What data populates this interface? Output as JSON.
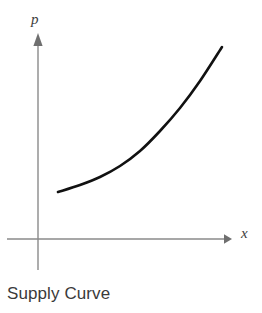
{
  "figure": {
    "caption": "Supply Curve",
    "background_color": "#ffffff",
    "axis_color": "#8a8a8a",
    "curve_color": "#111111",
    "label_color": "#3d3d3d",
    "caption_color": "#3a3a3a"
  },
  "axes": {
    "y_axis": {
      "label": "p",
      "label_name": "price",
      "arrow": "up",
      "x_px": 38,
      "top_px": 33,
      "bottom_px": 270
    },
    "x_axis": {
      "label": "x",
      "label_name": "quantity",
      "arrow": "right",
      "y_px": 239,
      "left_px": 7,
      "right_px": 231
    },
    "origin_px": {
      "x": 38,
      "y": 239
    }
  },
  "chart_data": {
    "type": "line",
    "title": "Supply Curve",
    "subtitle": "",
    "xlabel": "x",
    "ylabel": "p",
    "grid": false,
    "legend": null,
    "axis_arrows": true,
    "tick_labels": {
      "x": [],
      "y": []
    },
    "xlim": [
      0,
      1
    ],
    "ylim": [
      0,
      1
    ],
    "annotations": [],
    "series": [
      {
        "name": "Supply",
        "description": "Upward sloping convex supply curve: price increases with quantity supplied, increasing slope",
        "shape": "convex-increasing",
        "points_px": [
          {
            "x": 58,
            "y": 192
          },
          {
            "x": 80,
            "y": 185
          },
          {
            "x": 100,
            "y": 177
          },
          {
            "x": 120,
            "y": 166
          },
          {
            "x": 140,
            "y": 151
          },
          {
            "x": 160,
            "y": 131
          },
          {
            "x": 180,
            "y": 108
          },
          {
            "x": 200,
            "y": 81
          },
          {
            "x": 222,
            "y": 47
          }
        ],
        "data": {
          "x": [
            0.1,
            0.21,
            0.31,
            0.42,
            0.53,
            0.63,
            0.74,
            0.84,
            0.95
          ],
          "y": [
            0.2,
            0.23,
            0.27,
            0.32,
            0.38,
            0.47,
            0.57,
            0.68,
            0.83
          ]
        }
      }
    ]
  }
}
